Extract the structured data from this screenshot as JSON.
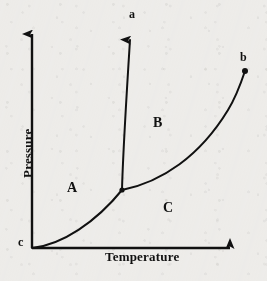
{
  "figure": {
    "kind": "pressure-temperature-phase-diagram",
    "background_color": "#f2f1ef",
    "ink_color": "#111111",
    "width": 267,
    "height": 281
  },
  "axes": {
    "x_title": "Temperature",
    "y_title": "Pressure",
    "origin": {
      "x": 32,
      "y": 248
    },
    "x_arrow_tip": {
      "x": 238,
      "y": 248
    },
    "y_arrow_tip": {
      "x": 32,
      "y": 26
    },
    "ticks": [],
    "grid": false
  },
  "regions": [
    {
      "id": "A",
      "label": "A",
      "x": 72,
      "y": 188
    },
    {
      "id": "B",
      "label": "B",
      "x": 158,
      "y": 123
    },
    {
      "id": "C",
      "label": "C",
      "x": 168,
      "y": 208
    }
  ],
  "points": [
    {
      "id": "a",
      "label": "a",
      "label_x": 133,
      "label_y": 14,
      "marker": "arrowhead",
      "marker_x": 130,
      "marker_y": 33
    },
    {
      "id": "b",
      "label": "b",
      "label_x": 244,
      "label_y": 58,
      "marker": "filled-dot",
      "marker_x": 245,
      "marker_y": 71
    },
    {
      "id": "c",
      "label": "c",
      "label_x": 22,
      "label_y": 242,
      "marker": "none",
      "marker_x": 32,
      "marker_y": 248
    }
  ],
  "curves": [
    {
      "id": "sublimation-curve",
      "name": "sublimation-curve",
      "from": "c",
      "to": "triple-point",
      "path": "M 32 248 C 62 245, 96 222, 122 190",
      "stroke_width": 2.0
    },
    {
      "id": "fusion-curve",
      "name": "fusion-curve",
      "from": "triple-point",
      "to": "a",
      "path": "M 122 190 C 123 150, 127 88, 130 40",
      "stroke_width": 2.0,
      "arrow_end": true
    },
    {
      "id": "vaporization-curve",
      "name": "vaporization-curve",
      "from": "triple-point",
      "to": "b",
      "path": "M 122 190 C 162 182, 200 156, 228 110 C 236 97, 241 83, 245 71",
      "stroke_width": 2.0
    }
  ],
  "triple_point": {
    "x": 122,
    "y": 190
  },
  "chart_data": {
    "type": "line",
    "title": "",
    "xlabel": "Temperature",
    "ylabel": "Pressure",
    "xlim": [
      0,
      1
    ],
    "ylim": [
      0,
      1
    ],
    "grid": false,
    "annotations": [
      "a",
      "b",
      "c",
      "A",
      "B",
      "C"
    ],
    "series": [
      {
        "name": "sublimation-curve",
        "x": [
          0.0,
          0.15,
          0.3,
          0.44
        ],
        "y": [
          0.0,
          0.02,
          0.09,
          0.26
        ]
      },
      {
        "name": "fusion-curve",
        "x": [
          0.44,
          0.45,
          0.46,
          0.475
        ],
        "y": [
          0.26,
          0.52,
          0.78,
          0.97
        ]
      },
      {
        "name": "vaporization-curve",
        "x": [
          0.44,
          0.6,
          0.75,
          0.88,
          1.0
        ],
        "y": [
          0.26,
          0.32,
          0.45,
          0.63,
          0.8
        ]
      }
    ]
  }
}
